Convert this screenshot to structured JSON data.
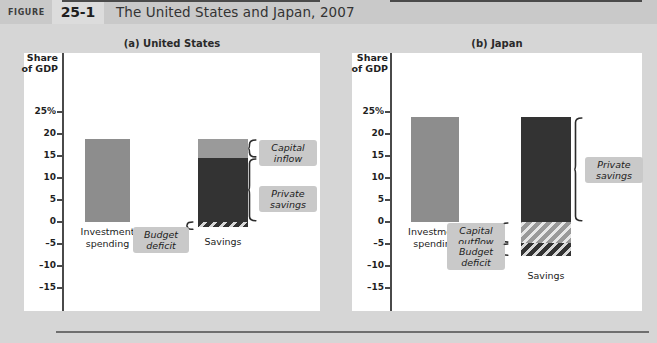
{
  "header": {
    "figure_word": "FIGURE",
    "figure_number": "25-1",
    "title": "The United States and Japan, 2007"
  },
  "axis": {
    "caption_line1": "Share",
    "caption_line2": "of GDP",
    "tick_labels": [
      "25%",
      "20",
      "15",
      "10",
      "5",
      "0",
      "–5",
      "–10",
      "–15"
    ],
    "tick_values": [
      25,
      20,
      15,
      10,
      5,
      0,
      -5,
      -10,
      -15
    ]
  },
  "colors": {
    "investment": "#8d8d8d",
    "private_savings": "#333333",
    "capital_flow": "#9a9a9a",
    "panel_background": "#ffffff",
    "page_background": "#d6d6d6",
    "header_background": "#c9c9c9",
    "callout_background": "#c9c9c9"
  },
  "panels": [
    {
      "id": "us",
      "title": "(a) United States",
      "bars": [
        {
          "label_line1": "Investment",
          "label_line2": "spending",
          "value": 18.8
        },
        {
          "label_line1": "Savings",
          "label_line2": "",
          "value": 18.8
        }
      ],
      "callouts": [
        {
          "line1": "Capital",
          "line2": "inflow"
        },
        {
          "line1": "Private",
          "line2": "savings"
        },
        {
          "line1": "Budget",
          "line2": "deficit"
        }
      ]
    },
    {
      "id": "jp",
      "title": "(b) Japan",
      "bars": [
        {
          "label_line1": "Investment",
          "label_line2": "spending",
          "value": 23.8
        },
        {
          "label_line1": "Savings",
          "label_line2": "",
          "value": 23.8
        }
      ],
      "callouts": [
        {
          "line1": "Capital",
          "line2": "outflow"
        },
        {
          "line1": "Budget",
          "line2": "deficit"
        },
        {
          "line1": "Private",
          "line2": "savings"
        }
      ]
    }
  ],
  "chart_data": {
    "type": "bar",
    "title": "The United States and Japan, 2007",
    "ylabel": "Share of GDP",
    "ylim": [
      -17,
      27
    ],
    "yticks": [
      25,
      20,
      15,
      10,
      5,
      0,
      -5,
      -10,
      -15
    ],
    "grid": false,
    "legend": "annotated braces",
    "panels": [
      {
        "name": "(a) United States",
        "categories": [
          "Investment spending",
          "Savings"
        ],
        "series": [
          {
            "name": "Investment spending",
            "values": [
              18.8,
              null
            ]
          },
          {
            "name": "Private savings",
            "values": [
              null,
              14.5
            ]
          },
          {
            "name": "Capital inflow",
            "values": [
              null,
              4.3
            ]
          },
          {
            "name": "Budget deficit",
            "values": [
              null,
              -1.2
            ]
          }
        ],
        "annotations": [
          "Capital inflow",
          "Private savings",
          "Budget deficit"
        ]
      },
      {
        "name": "(b) Japan",
        "categories": [
          "Investment spending",
          "Savings"
        ],
        "series": [
          {
            "name": "Investment spending",
            "values": [
              23.8,
              null
            ]
          },
          {
            "name": "Private savings",
            "values": [
              null,
              23.8
            ]
          },
          {
            "name": "Capital outflow",
            "values": [
              null,
              -4.8
            ]
          },
          {
            "name": "Budget deficit",
            "values": [
              null,
              -3.0
            ]
          }
        ],
        "annotations": [
          "Capital outflow",
          "Budget deficit",
          "Private savings"
        ]
      }
    ]
  }
}
